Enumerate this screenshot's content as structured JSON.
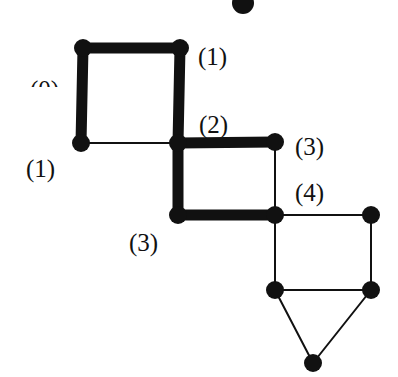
{
  "diagram": {
    "colors": {
      "ink": "#111111",
      "background": "#ffffff"
    },
    "nodes": [
      {
        "id": "top",
        "x": 243,
        "y": 3
      },
      {
        "id": "a",
        "x": 83,
        "y": 48
      },
      {
        "id": "b",
        "x": 180,
        "y": 48
      },
      {
        "id": "c",
        "x": 81,
        "y": 143
      },
      {
        "id": "d",
        "x": 178,
        "y": 143
      },
      {
        "id": "e",
        "x": 275,
        "y": 142
      },
      {
        "id": "f",
        "x": 178,
        "y": 215
      },
      {
        "id": "g",
        "x": 275,
        "y": 215
      },
      {
        "id": "h",
        "x": 371,
        "y": 215
      },
      {
        "id": "i",
        "x": 275,
        "y": 290
      },
      {
        "id": "j",
        "x": 371,
        "y": 290
      },
      {
        "id": "k",
        "x": 313,
        "y": 363
      }
    ],
    "edges": [
      {
        "from": "a",
        "to": "b",
        "bold": true
      },
      {
        "from": "a",
        "to": "c",
        "bold": true
      },
      {
        "from": "b",
        "to": "d",
        "bold": true
      },
      {
        "from": "c",
        "to": "d",
        "bold": false
      },
      {
        "from": "d",
        "to": "e",
        "bold": true
      },
      {
        "from": "d",
        "to": "f",
        "bold": true
      },
      {
        "from": "e",
        "to": "g",
        "bold": false
      },
      {
        "from": "f",
        "to": "g",
        "bold": true
      },
      {
        "from": "g",
        "to": "h",
        "bold": false
      },
      {
        "from": "g",
        "to": "i",
        "bold": false
      },
      {
        "from": "h",
        "to": "j",
        "bold": false
      },
      {
        "from": "i",
        "to": "j",
        "bold": false
      },
      {
        "from": "i",
        "to": "k",
        "bold": false
      },
      {
        "from": "j",
        "to": "k",
        "bold": false
      }
    ],
    "labels": [
      {
        "text": "(0)",
        "x": 30,
        "y": 77,
        "clipped": true
      },
      {
        "text": "(1)",
        "x": 198,
        "y": 44
      },
      {
        "text": "(2)",
        "x": 199,
        "y": 113
      },
      {
        "text": "(3)",
        "x": 295,
        "y": 134
      },
      {
        "text": "(1)",
        "x": 26,
        "y": 156
      },
      {
        "text": "(4)",
        "x": 295,
        "y": 180
      },
      {
        "text": "(3)",
        "x": 129,
        "y": 230
      }
    ]
  }
}
